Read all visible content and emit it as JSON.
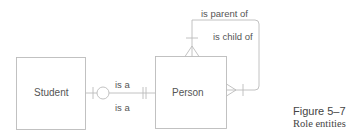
{
  "diagram": {
    "type": "entity-relationship",
    "entities": [
      {
        "id": "student",
        "label": "Student"
      },
      {
        "id": "person",
        "label": "Person"
      }
    ],
    "relationships": [
      {
        "from": "student",
        "to": "person",
        "label_top": "is a",
        "label_bottom": "is a",
        "student_end": "zero-or-one",
        "person_end": "exactly-one"
      },
      {
        "from": "person",
        "to": "person",
        "label_parent": "is parent of",
        "label_child": "is child of",
        "top_end": "one-or-many",
        "right_end": "one-or-many"
      }
    ],
    "line_color": "#bbbbbb",
    "text_color": "#555555"
  },
  "caption": {
    "figure_number": "Figure 5–7",
    "title": "Role entities"
  }
}
